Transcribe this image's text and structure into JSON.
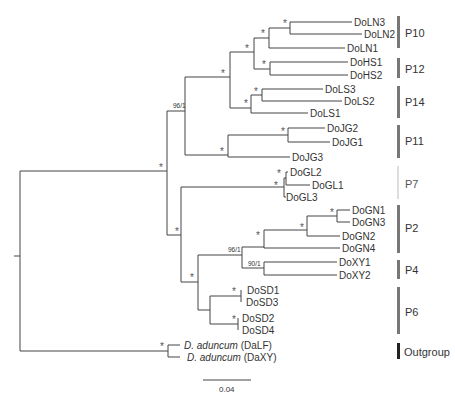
{
  "figure": {
    "type": "phylogenetic_tree",
    "scale_bar": {
      "label": "0.04"
    },
    "leaves": [
      {
        "name": "DoLN3",
        "group": "P10"
      },
      {
        "name": "DoLN2",
        "group": "P10"
      },
      {
        "name": "DoLN1",
        "group": "P10"
      },
      {
        "name": "DoHS1",
        "group": "P12"
      },
      {
        "name": "DoHS2",
        "group": "P12"
      },
      {
        "name": "DoLS3",
        "group": "P14"
      },
      {
        "name": "DoLS2",
        "group": "P14"
      },
      {
        "name": "DoLS1",
        "group": "P14"
      },
      {
        "name": "DoJG2",
        "group": "P11"
      },
      {
        "name": "DoJG1",
        "group": "P11"
      },
      {
        "name": "DoJG3",
        "group": "P11"
      },
      {
        "name": "DoGL2",
        "group": "P7"
      },
      {
        "name": "DoGL1",
        "group": "P7"
      },
      {
        "name": "DoGL3",
        "group": "P7"
      },
      {
        "name": "DoGN1",
        "group": "P2"
      },
      {
        "name": "DoGN3",
        "group": "P2"
      },
      {
        "name": "DoGN2",
        "group": "P2"
      },
      {
        "name": "DoGN4",
        "group": "P2"
      },
      {
        "name": "DoXY1",
        "group": "P4"
      },
      {
        "name": "DoXY2",
        "group": "P4"
      },
      {
        "name": "DoSD1",
        "group": "P6"
      },
      {
        "name": "DoSD3",
        "group": "P6"
      },
      {
        "name": "DoSD2",
        "group": "P6"
      },
      {
        "name": "DoSD4",
        "group": "P6"
      },
      {
        "name": "D. aduncum",
        "suffix": "(DaLF)",
        "group": "Outgroup"
      },
      {
        "name": "D. aduncum",
        "suffix": "(DaXY)",
        "group": "Outgroup"
      }
    ],
    "groups": [
      {
        "label": "P10",
        "color": "#777777"
      },
      {
        "label": "P12",
        "color": "#777777"
      },
      {
        "label": "P14",
        "color": "#777777"
      },
      {
        "label": "P11",
        "color": "#777777"
      },
      {
        "label": "P7",
        "color": "#dddddd"
      },
      {
        "label": "P2",
        "color": "#777777"
      },
      {
        "label": "P4",
        "color": "#777777"
      },
      {
        "label": "P6",
        "color": "#777777"
      },
      {
        "label": "Outgroup",
        "color": "#222222"
      }
    ],
    "support_values": {
      "star": "*",
      "n1": "96/1",
      "n2": "96/1",
      "n3": "90/1"
    }
  }
}
